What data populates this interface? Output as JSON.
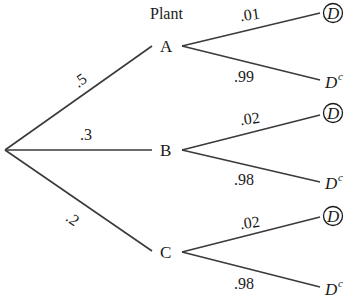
{
  "title": "Plant",
  "root": {
    "x": 5,
    "y": 150
  },
  "plants": [
    {
      "name": "A",
      "prob": ".5",
      "x": 165,
      "y": 46,
      "branches": [
        {
          "prob": ".01",
          "outcome": "D",
          "circled": true
        },
        {
          "prob": ".99",
          "outcome": "D",
          "superscript": "c",
          "circled": false
        }
      ]
    },
    {
      "name": "B",
      "prob": ".3",
      "x": 165,
      "y": 150,
      "branches": [
        {
          "prob": ".02",
          "outcome": "D",
          "circled": true
        },
        {
          "prob": ".98",
          "outcome": "D",
          "superscript": "c",
          "circled": false
        }
      ]
    },
    {
      "name": "C",
      "prob": ".2",
      "x": 165,
      "y": 252,
      "branches": [
        {
          "prob": ".02",
          "outcome": "D",
          "circled": true
        },
        {
          "prob": ".98",
          "outcome": "D",
          "superscript": "c",
          "circled": false
        }
      ]
    }
  ],
  "colors": {
    "line": "#3a3a3a",
    "text": "#1a1a1a",
    "background": "#ffffff"
  }
}
